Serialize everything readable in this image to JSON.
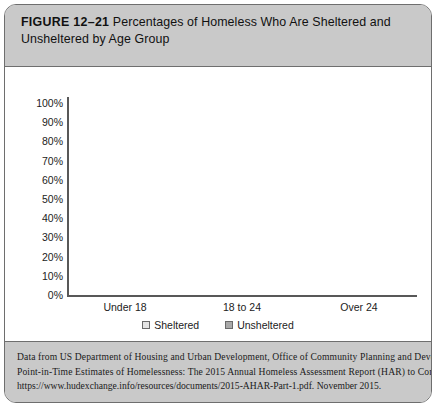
{
  "figure": {
    "label": "FIGURE 12–21",
    "title": "Percentages of Homeless Who Are Sheltered and Unsheltered by Age Group"
  },
  "chart_data": {
    "type": "bar",
    "subtype": "stacked-100-percent",
    "title": "Percentages of Homeless Who Are Sheltered and Unsheltered by Age Group",
    "categories": [
      "Under 18",
      "18 to 24",
      "Over 24"
    ],
    "series": [
      {
        "name": "Sheltered",
        "values": [
          91,
          67,
          63
        ],
        "color": "#dcdcdc"
      },
      {
        "name": "Unsheltered",
        "values": [
          9,
          33,
          37
        ],
        "color": "#aaaaaa"
      }
    ],
    "xlabel": "",
    "ylabel": "",
    "ylim": [
      0,
      100
    ],
    "yticks": [
      "0%",
      "10%",
      "20%",
      "30%",
      "40%",
      "50%",
      "60%",
      "70%",
      "80%",
      "90%",
      "100%"
    ],
    "ytick_values": [
      0,
      10,
      20,
      30,
      40,
      50,
      60,
      70,
      80,
      90,
      100
    ],
    "grid": false,
    "legend_position": "bottom"
  },
  "legend": {
    "items": [
      {
        "label": "Sheltered",
        "key": "sheltered"
      },
      {
        "label": "Unsheltered",
        "key": "unsheltered"
      }
    ]
  },
  "source": {
    "line1": "Data from US Department of Housing and Urban Development, Office of Community Planning and Development.",
    "line2": "Point-in-Time Estimates of Homelessness: The 2015 Annual Homeless Assessment Report (HAR) to Congress.",
    "line3": "https://www.hudexchange.info/resources/documents/2015-AHAR-Part-1.pdf. November 2015."
  },
  "colors": {
    "band": "#c9c9c9",
    "border": "#6e6e6e",
    "sheltered": "#dcdcdc",
    "unsheltered": "#aaaaaa",
    "axis": "#585858"
  }
}
